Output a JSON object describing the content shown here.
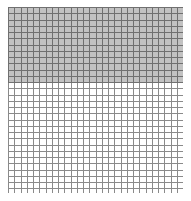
{
  "figure": {
    "title": "",
    "subtitle": "",
    "background_color": "#ffffff"
  },
  "plot_area": {
    "left_px": 8,
    "top_px": 7,
    "width_px": 175,
    "height_px": 186
  },
  "grid": {
    "cell_size_px": 6.25,
    "columns": 28,
    "rows": 30,
    "line_color": "#8a8a8a",
    "line_color_on_fill": "#707070",
    "line_width_px": 1,
    "visible": true
  },
  "shaded_region": {
    "fill_color": "#c2c2c2",
    "top_px": 0,
    "height_px": 76,
    "height_fraction": 0.409,
    "rows_covered": 12,
    "spans_full_width": true
  },
  "chart_data": {
    "type": "area",
    "title": "",
    "subtitle": "",
    "xlabel": "",
    "ylabel": "",
    "grid": true,
    "legend_position": "none",
    "xlim": [
      0,
      28
    ],
    "ylim": [
      0,
      30
    ],
    "xticks": [
      0,
      4,
      8,
      12,
      16,
      20,
      24,
      28
    ],
    "yticks": [
      0,
      5,
      10,
      15,
      20,
      25,
      30
    ],
    "xticklabels": [],
    "yticklabels": [],
    "series": [
      {
        "name": "filled-band",
        "fill_color": "#c2c2c2",
        "x": [
          0,
          28
        ],
        "y_lower": [
          18,
          18
        ],
        "y_upper": [
          30,
          30
        ]
      }
    ],
    "annotations": []
  }
}
